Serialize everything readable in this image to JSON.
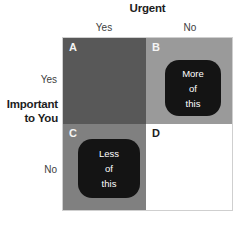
{
  "matrix": {
    "top_axis_title": "Urgent",
    "left_axis_title_line1": "Important",
    "left_axis_title_line2": "to You",
    "column_headers": [
      "Yes",
      "No"
    ],
    "row_headers": [
      "Yes",
      "No"
    ],
    "quadrants": [
      {
        "id": "A",
        "label": "A",
        "row": "Yes",
        "column": "Yes",
        "fill": "#585858",
        "label_color": "#f4f4f4",
        "callout": null
      },
      {
        "id": "B",
        "label": "B",
        "row": "Yes",
        "column": "No",
        "fill": "#9a9a9a",
        "label_color": "#f4f4f4",
        "callout": {
          "line1": "More",
          "line2": "of",
          "line3": "this",
          "fill": "#141414",
          "text_color": "#ffffff"
        }
      },
      {
        "id": "C",
        "label": "C",
        "row": "No",
        "column": "Yes",
        "fill": "#808080",
        "label_color": "#f4f4f4",
        "callout": {
          "line1": "Less",
          "line2": "of",
          "line3": "this",
          "fill": "#141414",
          "text_color": "#ffffff"
        }
      },
      {
        "id": "D",
        "label": "D",
        "row": "No",
        "column": "No",
        "fill": "#ffffff",
        "label_color": "#1d1d1d",
        "callout": null
      }
    ]
  }
}
